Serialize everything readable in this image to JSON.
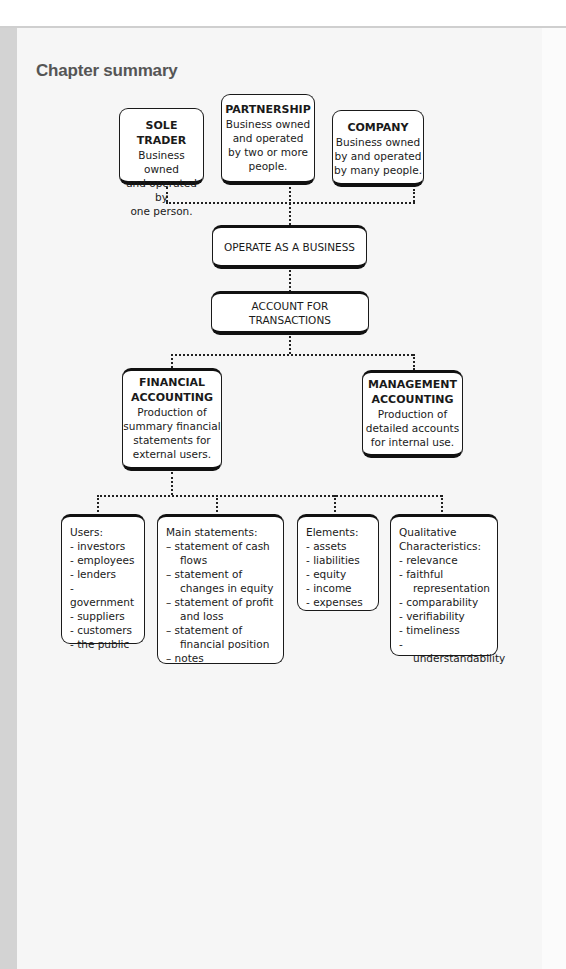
{
  "page": {
    "title": "Chapter summary"
  },
  "colors": {
    "page_bg": "#f6f6f6",
    "left_strip": "#d3d3d3",
    "title": "#555555",
    "box_border": "#1a1a1a"
  },
  "business_types": [
    {
      "heading": "SOLE TRADER",
      "lines": [
        "Business owned",
        "and operated by",
        "one person."
      ]
    },
    {
      "heading": "PARTNERSHIP",
      "lines": [
        "Business owned",
        "and operated",
        "by two or more",
        "people."
      ]
    },
    {
      "heading": "COMPANY",
      "lines": [
        "Business owned",
        "by  and operated",
        "by many people."
      ]
    }
  ],
  "flow": {
    "operate": "OPERATE AS A BUSINESS",
    "account": "ACCOUNT FOR TRANSACTIONS"
  },
  "accounting": [
    {
      "heading_1": "FINANCIAL",
      "heading_2": "ACCOUNTING",
      "lines": [
        "Production of",
        "summary financial",
        "statements for",
        "external users."
      ]
    },
    {
      "heading_1": "MANAGEMENT",
      "heading_2": "ACCOUNTING",
      "lines": [
        "Production of",
        "detailed accounts",
        "for internal use."
      ]
    }
  ],
  "details": {
    "users": {
      "heading": "Users:",
      "items": [
        "- investors",
        "- employees",
        "- lenders",
        "- government",
        "- suppliers",
        "- customers",
        "- the public"
      ]
    },
    "statements": {
      "heading": "Main statements:",
      "items": [
        "–  statement of cash flows",
        "–  statement of changes in equity",
        "–  statement of profit and loss",
        "–  statement of financial position",
        "–  notes"
      ]
    },
    "elements": {
      "heading": "Elements:",
      "items": [
        "- assets",
        "- liabilities",
        "- equity",
        "- income",
        "- expenses"
      ]
    },
    "qualitative": {
      "heading_1": "Qualitative",
      "heading_2": "Characteristics:",
      "items": [
        "- relevance",
        "- faithful representation",
        "- comparability",
        "- verifiability",
        "- timeliness",
        "- understandability"
      ]
    }
  }
}
